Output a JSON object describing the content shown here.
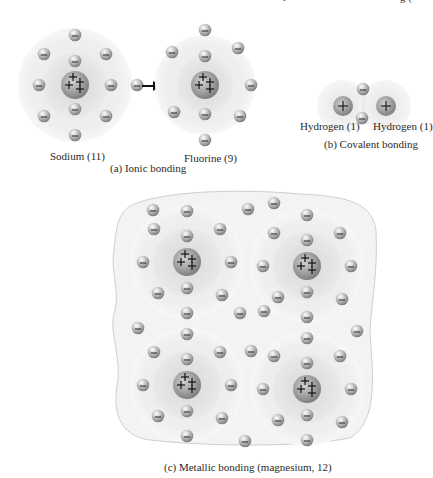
{
  "header_fragment": {
    "left": "r",
    "right": "g ("
  },
  "ionic": {
    "atoms": [
      {
        "name": "Sodium",
        "atomic_number": 11,
        "label": "Sodium (11)"
      },
      {
        "name": "Fluorine",
        "atomic_number": 9,
        "label": "Fluorine (9)"
      }
    ],
    "caption": "(a)  Ionic bonding"
  },
  "covalent": {
    "atoms": [
      {
        "name": "Hydrogen",
        "atomic_number": 1,
        "label": "Hydrogen (1)"
      },
      {
        "name": "Hydrogen",
        "atomic_number": 1,
        "label": "Hydrogen (1)"
      }
    ],
    "caption": "(b) Covalent bonding"
  },
  "metallic": {
    "element": "magnesium",
    "atomic_number": 12,
    "atom_count": 4,
    "caption": "(c) Metallic bonding (magnesium, 12)"
  },
  "symbols": {
    "nucleus_charge": "+",
    "electron_charge": "−"
  },
  "colors": {
    "electron": "#9a9a9a",
    "nucleus": "#8e8e8e",
    "shell": "#e4e4e4",
    "sea": "#f1f1f1",
    "arrow": "#111111"
  }
}
